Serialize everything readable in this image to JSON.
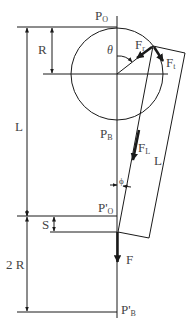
{
  "labels": {
    "p_o": {
      "main": "P",
      "sub": "O"
    },
    "p_b": {
      "main": "P",
      "sub": "B"
    },
    "p_prime_o": {
      "main": "P'",
      "sub": "O"
    },
    "p_prime_b": {
      "main": "P'",
      "sub": "B"
    },
    "r": "R",
    "l_left": "L",
    "l_right": "L",
    "s": "S",
    "two_r": "2 R",
    "theta": "θ",
    "phi": "ϕ",
    "f_r": {
      "main": "F",
      "sub": "r"
    },
    "f_t": {
      "main": "F",
      "sub": "t"
    },
    "f_l": {
      "main": "F",
      "sub": "L"
    },
    "f": "F"
  },
  "colors": {
    "line": "#1a1a1a",
    "text": "#444444",
    "background": "#ffffff"
  }
}
